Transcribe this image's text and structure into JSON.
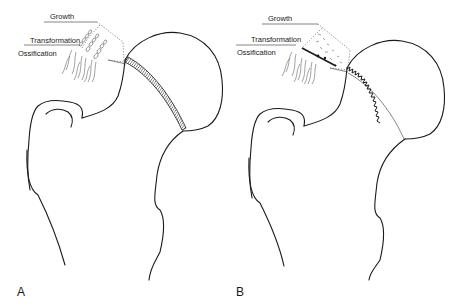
{
  "figure": {
    "panels": [
      {
        "letter": "A",
        "physis_style": "hatched band (intact)",
        "labels": {
          "growth": "Growth",
          "transformation": "Transformation",
          "ossification": "Ossification"
        }
      },
      {
        "letter": "B",
        "physis_style": "jagged serrated line (disrupted)",
        "labels": {
          "growth": "Growth",
          "transformation": "Transformation",
          "ossification": "Ossification"
        }
      }
    ],
    "colors": {
      "line": "#1a1a1a",
      "background": "#ffffff"
    }
  }
}
